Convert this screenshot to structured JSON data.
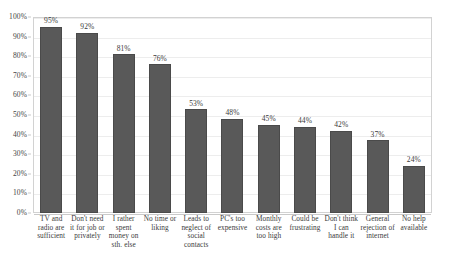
{
  "chart_data": {
    "type": "bar",
    "title": "",
    "subtitle": "",
    "xlabel": "",
    "ylabel": "",
    "ylim": [
      0,
      100
    ],
    "yticks": [
      "0%",
      "10%",
      "20%",
      "30%",
      "40%",
      "50%",
      "60%",
      "70%",
      "80%",
      "90%",
      "100%"
    ],
    "ytick_values": [
      0,
      10,
      20,
      30,
      40,
      50,
      60,
      70,
      80,
      90,
      100
    ],
    "grid": "horizontal",
    "legend": "none",
    "bar_color": "#595959",
    "bar_border_color": "#4a4a4a",
    "plot_border_color": "#d2d2d2",
    "gridline_color": "#ededed",
    "categories": [
      "TV and radio are sufficient",
      "Don't need it for job or privately",
      "I rather spent money on sth. else",
      "No time or liking",
      "Leads to neglect of social contacts",
      "PC's too expensive",
      "Monthly costs are too high",
      "Could be frustrating",
      "Don't think I can handle it",
      "General rejection of internet",
      "No help available"
    ],
    "category_lines": [
      [
        "TV and",
        "radio are",
        "sufficient"
      ],
      [
        "Don't need",
        "it for job or",
        "privately"
      ],
      [
        "I rather",
        "spent",
        "money on",
        "sth. else"
      ],
      [
        "No time or",
        "liking"
      ],
      [
        "Leads to",
        "neglect of",
        "social",
        "contacts"
      ],
      [
        "PC's too",
        "expensive"
      ],
      [
        "Monthly",
        "costs are",
        "too high"
      ],
      [
        "Could be",
        "frustrating"
      ],
      [
        "Don't think",
        "I can",
        "handle it"
      ],
      [
        "General",
        "rejection of",
        "internet"
      ],
      [
        "No help",
        "available"
      ]
    ],
    "values": [
      95,
      92,
      81,
      76,
      53,
      48,
      45,
      44,
      42,
      37,
      24
    ],
    "data_labels": [
      "95%",
      "92%",
      "81%",
      "76%",
      "53%",
      "48%",
      "45%",
      "44%",
      "42%",
      "37%",
      "24%"
    ]
  }
}
